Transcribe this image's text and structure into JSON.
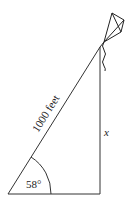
{
  "diagram": {
    "hypotenuse_label": "1000 feet",
    "angle_label": "58°",
    "opposite_label": "x",
    "line_color": "#222222",
    "background": "#ffffff"
  }
}
